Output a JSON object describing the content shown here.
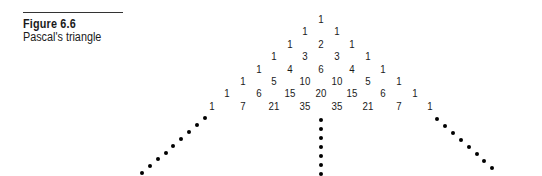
{
  "figure": {
    "label": "Figure 6.6",
    "caption": "Pascal's triangle"
  },
  "triangle": {
    "rows": [
      [
        "1"
      ],
      [
        "1",
        "1"
      ],
      [
        "1",
        "2",
        "1"
      ],
      [
        "1",
        "3",
        "3",
        "1"
      ],
      [
        "1",
        "4",
        "6",
        "4",
        "1"
      ],
      [
        "1",
        "5",
        "10",
        "10",
        "5",
        "1"
      ],
      [
        "1",
        "6",
        "15",
        "20",
        "15",
        "6",
        "1"
      ],
      [
        "1",
        "7",
        "21",
        "35",
        "35",
        "21",
        "7",
        "1"
      ]
    ],
    "continuation": "dotted lines extending left edge, center, and right edge"
  }
}
